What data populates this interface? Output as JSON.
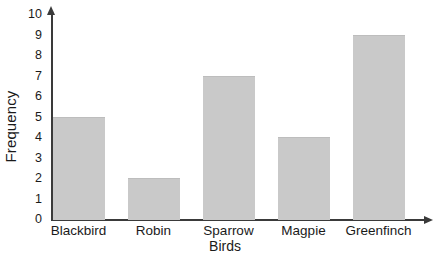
{
  "chart_data": {
    "type": "bar",
    "title": "",
    "xlabel": "Birds",
    "ylabel": "Frequency",
    "categories": [
      "Blackbird",
      "Robin",
      "Sparrow",
      "Magpie",
      "Greenfinch"
    ],
    "values": [
      5,
      2,
      7,
      4,
      9
    ],
    "ylim": [
      0,
      10
    ],
    "yticks": [
      0,
      1,
      2,
      3,
      4,
      5,
      6,
      7,
      8,
      9,
      10
    ],
    "ytick_labels": [
      "0",
      "1",
      "2",
      "3",
      "4",
      "5",
      "6",
      "7",
      "8",
      "9",
      "10"
    ],
    "grid": false,
    "legend": false,
    "legend_position": "none",
    "bar_color": "#c9c9c9",
    "axis_color": "#3a3a3a",
    "text_color": "#1a1a1a",
    "background_color": "#ffffff"
  }
}
